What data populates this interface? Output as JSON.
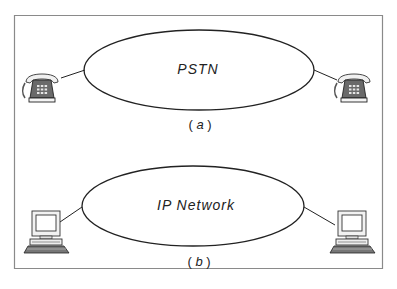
{
  "diagram": {
    "panel_a": {
      "network_label": "PSTN",
      "caption_open": "(",
      "caption_letter": "a",
      "caption_close": ")",
      "endpoints": [
        "telephone-left",
        "telephone-right"
      ]
    },
    "panel_b": {
      "network_label": "IP Network",
      "caption_open": "(",
      "caption_letter": "b",
      "caption_close": ")",
      "endpoints": [
        "computer-left",
        "computer-right"
      ]
    },
    "colors": {
      "frame": "#8a8a8a",
      "line": "#222222",
      "device_body": "#e8e8e8",
      "device_dark": "#555555",
      "background": "#ffffff"
    }
  }
}
